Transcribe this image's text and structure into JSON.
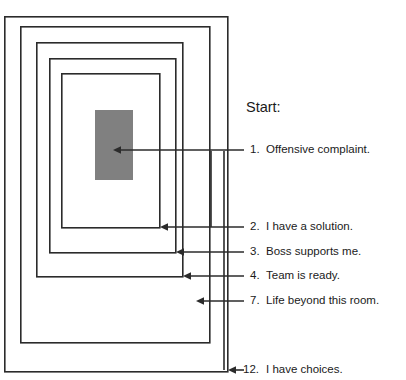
{
  "diagram": {
    "title_label": "Start:",
    "core": {
      "name": "core-block",
      "color": "#808080",
      "x": 95,
      "y": 110,
      "width": 38,
      "height": 70
    },
    "stroke_color": "#2b2b2b",
    "background_color": "#ffffff",
    "rings": [
      {
        "id": "ring-12",
        "x": 4,
        "y": 16,
        "width": 224,
        "height": 356,
        "step": 12
      },
      {
        "id": "ring-7",
        "x": 20,
        "y": 26,
        "width": 190,
        "height": 318,
        "step": 7
      },
      {
        "id": "ring-4",
        "x": 36,
        "y": 42,
        "width": 147,
        "height": 284,
        "step": 4
      },
      {
        "id": "ring-3",
        "x": 49,
        "y": 58,
        "width": 127,
        "height": 248,
        "step": 3
      },
      {
        "id": "ring-2",
        "x": 61,
        "y": 73,
        "width": 99,
        "height": 216,
        "step": 2
      }
    ],
    "labels": [
      {
        "id": "label-1",
        "number": "1.",
        "text": "Offensive complaint.",
        "y": 150,
        "arrow_tip_x": 139,
        "leader_start_x": 244
      },
      {
        "id": "label-2",
        "number": "2.",
        "text": "I have a solution.",
        "y": 227,
        "arrow_tip_x": 160,
        "leader_start_x": 244
      },
      {
        "id": "label-3",
        "number": "3.",
        "text": "Boss supports me.",
        "y": 252,
        "arrow_tip_x": 176,
        "leader_start_x": 244
      },
      {
        "id": "label-4",
        "number": "4.",
        "text": "Team is ready.",
        "y": 276,
        "arrow_tip_x": 183,
        "leader_start_x": 244
      },
      {
        "id": "label-7",
        "number": "7.",
        "text": "Life beyond this room.",
        "y": 301,
        "arrow_tip_x": 196,
        "leader_start_x": 244
      },
      {
        "id": "label-12",
        "number": "12.",
        "text": "I have choices.",
        "y": 370,
        "arrow_tip_x": 228,
        "leader_start_x": 244
      }
    ]
  }
}
